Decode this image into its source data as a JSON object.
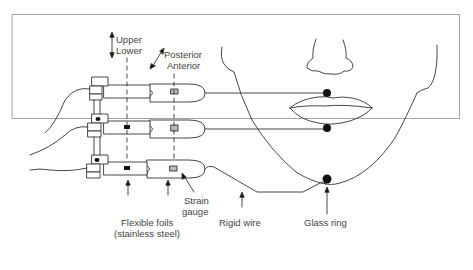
{
  "figure": {
    "type": "schematic",
    "labels": {
      "vertical_axis_top": "Upper",
      "vertical_axis_bottom": "Lower",
      "ap_axis_top": "Posterior",
      "ap_axis_bottom": "Anterior",
      "strain_gauge_1": "Strain",
      "strain_gauge_2": "gauge",
      "flexible_foils_1": "Flexible foils",
      "flexible_foils_2": "(stainless steel)",
      "rigid_wire": "Rigid wire",
      "glass_ring": "Glass ring"
    },
    "components": [
      {
        "name": "Upper lip transducer",
        "attach": "upper lip"
      },
      {
        "name": "Lower lip transducer",
        "attach": "lower lip"
      },
      {
        "name": "Jaw transducer",
        "attach": "chin"
      }
    ],
    "colors": {
      "line": "#333333",
      "gauge_fill": "#bbbbbb",
      "border": "#999999"
    }
  }
}
